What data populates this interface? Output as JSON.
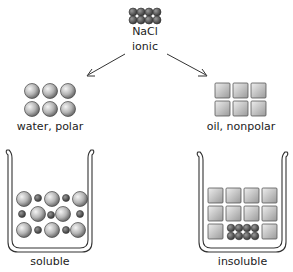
{
  "top": {
    "formula": "NaCl",
    "type": "ionic"
  },
  "left": {
    "solvent_label": "water, polar",
    "result_label": "soluble"
  },
  "right": {
    "solvent_label": "oil, nonpolar",
    "result_label": "insoluble"
  },
  "colors": {
    "ink": "#333333",
    "sphere": "#b8b8b8",
    "ion": "#666666",
    "cube": "#c4c4c4"
  }
}
